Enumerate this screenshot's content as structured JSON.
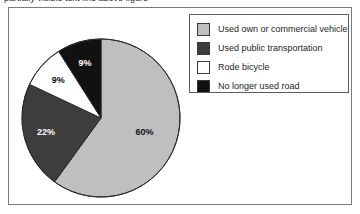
{
  "top_cutoff_text": "partially visible text line above figure",
  "chart_data": {
    "type": "pie",
    "title": "",
    "subtitle": "",
    "xlabel": "",
    "ylabel": "",
    "legend_position": "right",
    "grid": false,
    "categories": [
      "Used own or commercial vehicle",
      "Used public transportation",
      "Rode bicycle",
      "No longer used road"
    ],
    "values": [
      60,
      22,
      9,
      9
    ],
    "value_labels": [
      "60%",
      "22%",
      "9%",
      "9%"
    ],
    "colors": [
      "#bfbfbf",
      "#3d3d3d",
      "#ffffff",
      "#111111"
    ],
    "slice_label_colors": [
      "#111111",
      "#ffffff",
      "#111111",
      "#ffffff"
    ],
    "units": "percent",
    "start_angle_deg": 0,
    "direction": "clockwise"
  },
  "legend": {
    "items": [
      {
        "label": "Used own or commercial vehicle",
        "color": "#bfbfbf"
      },
      {
        "label": "Used public transportation",
        "color": "#3d3d3d"
      },
      {
        "label": "Rode bicycle",
        "color": "#ffffff"
      },
      {
        "label": "No longer used road",
        "color": "#111111"
      }
    ]
  },
  "slice_labels": [
    {
      "text": "60%",
      "x": 103,
      "y": 139,
      "color": "#111111"
    },
    {
      "text": "22%",
      "x": 38,
      "y": 101,
      "color": "#ffffff"
    },
    {
      "text": "9%",
      "x": 43,
      "y": 66,
      "color": "#111111"
    },
    {
      "text": "9%",
      "x": 75,
      "y": 48,
      "color": "#ffffff"
    }
  ]
}
